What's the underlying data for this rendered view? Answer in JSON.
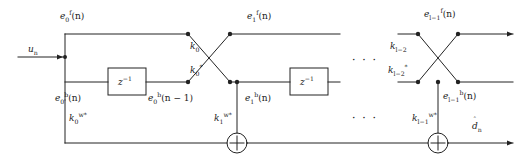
{
  "diagram": {
    "stroke_color": "#222222",
    "background_color": "#ffffff"
  },
  "signals": {
    "input": "u",
    "input_sub": "n",
    "forward_stage0": "e",
    "forward_stage0_sub": "0",
    "forward_stage0_sup": "f",
    "forward_stage0_arg": "(n)",
    "forward_stage1": "e",
    "forward_stage1_sub": "1",
    "forward_stage1_sup": "f",
    "forward_stage1_arg": "(n)",
    "forward_last": "e",
    "forward_last_sub": "l−1",
    "forward_last_sup": "f",
    "forward_last_arg": "(n)",
    "backward_stage0": "e",
    "backward_stage0_sub": "0",
    "backward_stage0_sup": "b",
    "backward_stage0_arg": "(n)",
    "backward_stage0_delayed": "e",
    "backward_stage0_delayed_sub": "0",
    "backward_stage0_delayed_sup": "b",
    "backward_stage0_delayed_arg": "(n − 1)",
    "backward_stage1": "e",
    "backward_stage1_sub": "1",
    "backward_stage1_sup": "b",
    "backward_stage1_arg": "(n)",
    "backward_last": "e",
    "backward_last_sub": "l−1",
    "backward_last_sup": "b",
    "backward_last_arg": "(n)",
    "output": "d",
    "output_sub": "n",
    "output_hat": "ˆ"
  },
  "coefficients": {
    "reflection_down0": "k",
    "reflection_down0_sub": "0",
    "reflection_up0": "k",
    "reflection_up0_sub": "0",
    "reflection_up0_sup": "*",
    "reflection_down_last": "k",
    "reflection_down_last_sub": "l−2",
    "reflection_up_last": "k",
    "reflection_up_last_sub": "l−2",
    "reflection_up_last_sup": "*",
    "ladder0": "k",
    "ladder0_sub": "0",
    "ladder0_sup": "w*",
    "ladder1": "k",
    "ladder1_sub": "1",
    "ladder1_sup": "w*",
    "ladder_last": "k",
    "ladder_last_sub": "l−1",
    "ladder_last_sup": "w*"
  },
  "blocks": {
    "delay_label": "z",
    "delay_exponent": "−1",
    "delay_count": 2,
    "summer_symbol": "+",
    "summer_count": 2
  },
  "ellipsis": {
    "forward_gap": "· · ·",
    "backward_gap": "· · ·"
  }
}
